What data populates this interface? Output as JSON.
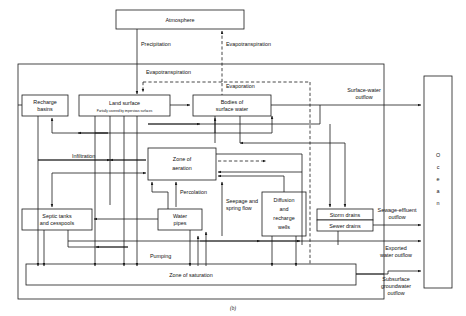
{
  "figure": {
    "caption": "(b)",
    "title_hidden": "Hydrologic cycle flow diagram"
  },
  "boxes": {
    "atmosphere": {
      "label": "Atmosphere"
    },
    "recharge_basins": {
      "line1": "Recharge",
      "line2": "basins"
    },
    "land_surface": {
      "line1": "Land surface",
      "subtitle": "Partially covered by impervious surfaces"
    },
    "bodies_surface_water": {
      "line1": "Bodies of",
      "line2": "surface water"
    },
    "zone_aeration": {
      "line1": "Zone of",
      "line2": "aeration"
    },
    "septic_tanks": {
      "line1": "Septic tanks",
      "line2": "and cesspools"
    },
    "water_pipes": {
      "line1": "Water",
      "line2": "pipes"
    },
    "diffusion_wells": {
      "line1": "Diffusion",
      "line2": "and",
      "line3": "recharge",
      "line4": "wells"
    },
    "storm_drains": {
      "label": "Storm drains"
    },
    "sewer_drains": {
      "label": "Sewer drains"
    },
    "zone_saturation": {
      "label": "Zone of saturation"
    },
    "ocean": {
      "label": "Ocean",
      "letters": [
        "O",
        "c",
        "e",
        "a",
        "n"
      ]
    }
  },
  "flow_labels": {
    "precipitation": "Precipitation",
    "evapotranspiration_top": "Evapotranspiration",
    "evapotranspiration_inner": "Evapotranspiration",
    "evaporation": "Evaporation",
    "infiltration": "Infiltration",
    "percolation": "Percolation",
    "seepage_line1": "Seepage and",
    "seepage_line2": "spring flow",
    "pumping": "Pumping"
  },
  "outflows": {
    "surface_water": {
      "line1": "Surface-water",
      "line2": "outflow"
    },
    "sewage_effluent": {
      "line1": "Sewage-effluent",
      "line2": "outflow"
    },
    "exported_water": {
      "line1": "Exported",
      "line2": "water outflow"
    },
    "subsurface_groundwater": {
      "line1": "Subsurface",
      "line2": "groundwater",
      "line3": "outflow"
    }
  },
  "colors": {
    "stroke": "#1a1a1a",
    "background": "#ffffff",
    "text": "#111111"
  }
}
